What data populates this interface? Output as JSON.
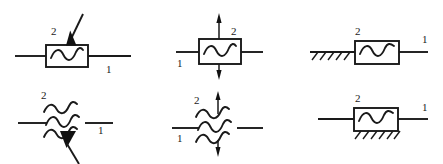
{
  "figure": {
    "background_color": "#ffffff",
    "line_color": "#1a1a1a",
    "width": 443,
    "height": 164,
    "symbols": [
      {
        "id": "top-left",
        "name": "boxed-wave-with-downward-solid-arrow",
        "body": "rectangle",
        "element": "single-wave",
        "leads": "horizontal-both-sides",
        "actuator": "solid-arrow-diagonal-down-into-top",
        "labels": {
          "terminal_2": "2",
          "terminal_1": "1"
        }
      },
      {
        "id": "top-middle",
        "name": "boxed-wave-with-vertical-arrows",
        "body": "rectangle",
        "element": "single-wave",
        "leads": "horizontal-both-sides",
        "actuator": "vertical-arrows-up-and-down",
        "labels": {
          "terminal_2": "2",
          "terminal_1": "1"
        }
      },
      {
        "id": "top-right",
        "name": "boxed-wave-with-left-ground-hatching",
        "body": "rectangle",
        "element": "single-wave",
        "leads": "horizontal-right-side",
        "actuator": "hatched-fixed-support-left",
        "labels": {
          "terminal_2": "2",
          "terminal_1": "1"
        }
      },
      {
        "id": "bottom-left",
        "name": "triple-wave-with-upward-solid-arrow",
        "body": "none",
        "element": "triple-wave",
        "leads": "horizontal-both-sides",
        "actuator": "solid-arrow-diagonal-up-into-waves",
        "labels": {
          "terminal_2": "2",
          "terminal_1": "1"
        }
      },
      {
        "id": "bottom-middle",
        "name": "triple-wave-with-vertical-arrows",
        "body": "none",
        "element": "triple-wave",
        "leads": "horizontal-both-sides",
        "actuator": "vertical-arrows-up-and-down",
        "labels": {
          "terminal_2": "2",
          "terminal_1": "1"
        }
      },
      {
        "id": "bottom-right",
        "name": "boxed-wave-with-bottom-ground-hatching",
        "body": "rectangle",
        "element": "single-wave",
        "leads": "horizontal-both-sides",
        "actuator": "hatched-fixed-support-bottom",
        "labels": {
          "terminal_2": "2",
          "terminal_1": "1"
        }
      }
    ],
    "labels": {
      "two": "2",
      "one": "1"
    }
  }
}
